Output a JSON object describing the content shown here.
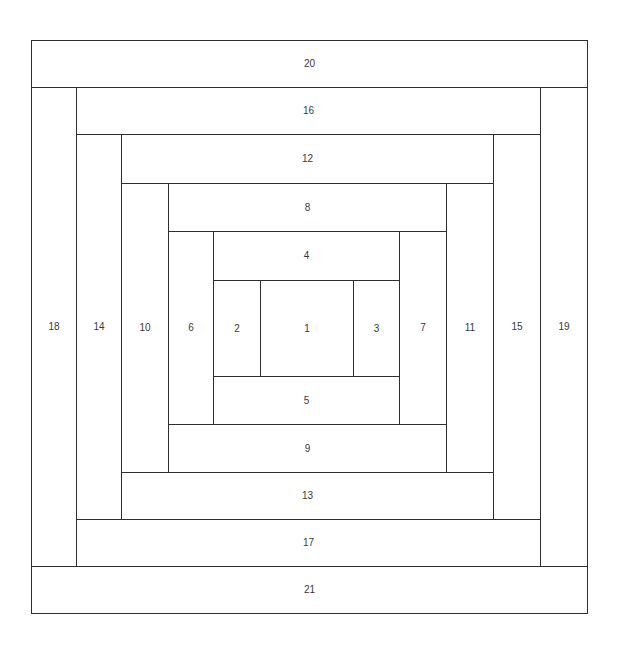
{
  "diagram": {
    "type": "log-cabin-quilt-block",
    "pieces": [
      {
        "label": "1",
        "x": 260,
        "y": 280,
        "w": 94,
        "h": 97
      },
      {
        "label": "2",
        "x": 213,
        "y": 280,
        "w": 48,
        "h": 97
      },
      {
        "label": "3",
        "x": 353,
        "y": 280,
        "w": 47,
        "h": 97
      },
      {
        "label": "4",
        "x": 213,
        "y": 231,
        "w": 187,
        "h": 50
      },
      {
        "label": "5",
        "x": 213,
        "y": 376,
        "w": 187,
        "h": 49
      },
      {
        "label": "6",
        "x": 168,
        "y": 231,
        "w": 46,
        "h": 194
      },
      {
        "label": "7",
        "x": 399,
        "y": 231,
        "w": 48,
        "h": 194
      },
      {
        "label": "8",
        "x": 168,
        "y": 183,
        "w": 279,
        "h": 49
      },
      {
        "label": "9",
        "x": 168,
        "y": 424,
        "w": 279,
        "h": 49
      },
      {
        "label": "10",
        "x": 121,
        "y": 183,
        "w": 48,
        "h": 290
      },
      {
        "label": "11",
        "x": 446,
        "y": 183,
        "w": 48,
        "h": 290
      },
      {
        "label": "12",
        "x": 121,
        "y": 134,
        "w": 373,
        "h": 50
      },
      {
        "label": "13",
        "x": 121,
        "y": 472,
        "w": 373,
        "h": 48
      },
      {
        "label": "14",
        "x": 76,
        "y": 134,
        "w": 46,
        "h": 386
      },
      {
        "label": "15",
        "x": 493,
        "y": 134,
        "w": 48,
        "h": 386
      },
      {
        "label": "16",
        "x": 76,
        "y": 87,
        "w": 465,
        "h": 48
      },
      {
        "label": "17",
        "x": 76,
        "y": 519,
        "w": 465,
        "h": 48
      },
      {
        "label": "18",
        "x": 31,
        "y": 87,
        "w": 46,
        "h": 480
      },
      {
        "label": "19",
        "x": 540,
        "y": 87,
        "w": 48,
        "h": 480
      },
      {
        "label": "20",
        "x": 31,
        "y": 40,
        "w": 557,
        "h": 48
      },
      {
        "label": "21",
        "x": 31,
        "y": 566,
        "w": 557,
        "h": 48
      }
    ],
    "colors": {
      "stroke": "#2e2e2e",
      "fill": "#ffffff",
      "label": "#3a3a3a"
    }
  }
}
